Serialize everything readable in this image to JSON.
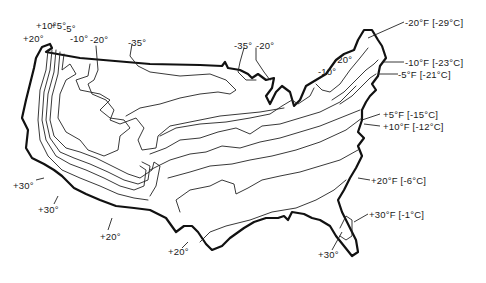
{
  "map": {
    "subject": "Contiguous United States winter minimum temperature isotherms",
    "style": "hand-drawn line map",
    "colors": {
      "ink": "#111111",
      "background": "#ffffff"
    },
    "labels": {
      "west_plus20": "+20°",
      "west_plus10": "+10°",
      "west_plus5": "+5°",
      "west_minus5": "-5°",
      "west_minus10": "-10°",
      "west_minus20": "-20°",
      "north_minus35": "-35°",
      "lakes_minus35": "-35°",
      "lakes_minus20": "-20°",
      "east_minus20": "-20°",
      "east_minus10": "-10°",
      "ne_minus20": "-20°F [-29°C]",
      "ne_minus10": "-10°F [-23°C]",
      "ne_minus5": "-5°F [-21°C]",
      "ec_plus5": "+5°F [-15°C]",
      "ec_plus10": "+10°F [-12°C]",
      "ec_plus20": "+20°F [-6°C]",
      "se_plus30": "+30°F [-1°C]",
      "fl_plus30": "+30°",
      "ca_plus30_a": "+30°",
      "ca_plus30_b": "+30°",
      "sw_plus20_a": "+20°",
      "sw_plus20_b": "+20°"
    }
  }
}
